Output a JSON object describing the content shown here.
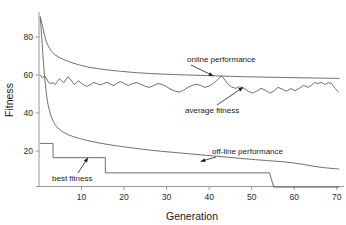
{
  "chart_data": {
    "type": "line",
    "title": "",
    "xlabel": "Generation",
    "ylabel": "Fitness",
    "xlim": [
      0,
      71
    ],
    "ylim": [
      0,
      92
    ],
    "grid": false,
    "legend_position": "inline-annotations",
    "xticks": [
      10,
      20,
      30,
      40,
      50,
      60,
      70
    ],
    "yticks": [
      20,
      40,
      60,
      80
    ],
    "xtick_labels": [
      "10",
      "20",
      "30",
      "40",
      "50",
      "60",
      "70"
    ],
    "ytick_labels": [
      "20",
      "40",
      "60",
      "80"
    ],
    "annotations": [
      {
        "text": "online performance",
        "target_x": 41,
        "target_y": 59.5
      },
      {
        "text": "average fitness",
        "target_x": 48,
        "target_y": 53.5
      },
      {
        "text": "off-line performance",
        "target_x": 38,
        "target_y": 14.5
      },
      {
        "text": "best fitness",
        "target_x": 11.5,
        "target_y": 16.5
      }
    ],
    "series": [
      {
        "name": "online performance",
        "x": [
          0.3,
          0.8,
          1.2,
          1.6,
          2.0,
          2.5,
          3.0,
          3.5,
          4.0,
          5.0,
          6.0,
          7.0,
          8.0,
          9.0,
          10.0,
          12.0,
          14.0,
          16.0,
          18.0,
          20.0,
          23.0,
          26.0,
          29.0,
          32.0,
          35.0,
          38.0,
          41.0,
          45.0,
          50.0,
          55.0,
          60.0,
          65.0,
          70.5
        ],
        "values": [
          90.5,
          86.0,
          82.0,
          78.5,
          76.0,
          74.0,
          72.3,
          71.2,
          70.3,
          69.0,
          68.0,
          67.1,
          66.3,
          65.6,
          65.0,
          64.0,
          63.3,
          62.7,
          62.2,
          61.8,
          61.2,
          60.8,
          60.5,
          60.2,
          60.0,
          59.8,
          59.6,
          59.3,
          59.0,
          58.8,
          58.6,
          58.4,
          58.2
        ]
      },
      {
        "name": "average fitness",
        "x": [
          0.3,
          0.8,
          1.3,
          1.8,
          2.3,
          2.8,
          3.3,
          3.8,
          4.3,
          4.8,
          5.3,
          5.8,
          6.3,
          6.8,
          7.3,
          7.8,
          8.3,
          8.8,
          9.3,
          9.8,
          10.5,
          11.2,
          12.0,
          12.8,
          13.6,
          14.4,
          15.2,
          16.0,
          16.8,
          17.6,
          18.4,
          19.2,
          20.0,
          21.0,
          22.0,
          23.0,
          24.0,
          25.0,
          26.0,
          27.0,
          28.0,
          29.0,
          30.0,
          31.0,
          32.0,
          33.0,
          34.0,
          35.0,
          36.0,
          37.0,
          38.0,
          39.0,
          40.0,
          41.0,
          42.0,
          42.8,
          43.5,
          44.3,
          45.2,
          46.2,
          47.2,
          48.2,
          49.2,
          50.2,
          51.2,
          52.2,
          53.2,
          54.2,
          55.2,
          56.2,
          57.2,
          58.2,
          59.2,
          60.2,
          61.2,
          62.2,
          63.2,
          64.0,
          64.8,
          65.6,
          66.4,
          67.2,
          68.0,
          68.8,
          69.6,
          70.4
        ],
        "values": [
          60.0,
          58.5,
          59.5,
          58.0,
          56.0,
          55.5,
          56.0,
          55.0,
          56.5,
          58.0,
          57.0,
          56.0,
          57.5,
          59.0,
          58.0,
          56.5,
          55.0,
          55.8,
          57.0,
          56.0,
          54.8,
          54.0,
          54.8,
          56.0,
          55.5,
          54.8,
          55.5,
          56.2,
          55.2,
          54.5,
          55.8,
          56.5,
          55.5,
          54.5,
          55.5,
          56.0,
          55.0,
          54.0,
          53.5,
          54.5,
          55.5,
          55.0,
          53.8,
          52.5,
          51.5,
          51.0,
          52.0,
          53.5,
          54.5,
          55.2,
          54.5,
          53.5,
          54.2,
          55.5,
          57.5,
          59.5,
          58.0,
          55.5,
          53.8,
          53.0,
          53.8,
          53.0,
          51.5,
          50.5,
          51.5,
          53.0,
          52.0,
          50.5,
          51.5,
          53.5,
          52.5,
          51.5,
          52.8,
          51.8,
          53.0,
          54.5,
          53.5,
          54.5,
          56.0,
          55.5,
          56.2,
          55.0,
          56.0,
          55.5,
          53.0,
          51.0
        ]
      },
      {
        "name": "off-line performance",
        "x": [
          0.3,
          0.7,
          1.1,
          1.5,
          2.0,
          2.5,
          3.0,
          3.5,
          4.0,
          5.0,
          6.0,
          7.0,
          8.0,
          9.0,
          10.0,
          12.0,
          14.0,
          16.0,
          18.0,
          20.0,
          23.0,
          26.0,
          29.0,
          32.0,
          35.0,
          38.0,
          41.0,
          44.0,
          47.0,
          50.0,
          54.0,
          58.0,
          62.0,
          66.0,
          70.5
        ],
        "values": [
          90.5,
          78.0,
          65.0,
          55.0,
          46.0,
          41.0,
          37.5,
          35.0,
          33.2,
          31.0,
          29.6,
          28.5,
          27.6,
          26.9,
          26.3,
          25.2,
          24.3,
          23.5,
          22.8,
          22.2,
          21.3,
          20.5,
          19.8,
          19.2,
          18.6,
          18.0,
          17.4,
          16.8,
          16.2,
          15.6,
          14.9,
          14.2,
          13.0,
          11.5,
          10.5
        ]
      },
      {
        "name": "best fitness",
        "step": true,
        "x": [
          0.3,
          3.3,
          3.3,
          15.6,
          15.6,
          54.2,
          54.2,
          55.2,
          55.2,
          70.5
        ],
        "values": [
          24.0,
          24.0,
          16.5,
          16.5,
          8.5,
          8.5,
          8.5,
          1.0,
          1.0,
          1.0
        ]
      }
    ]
  }
}
